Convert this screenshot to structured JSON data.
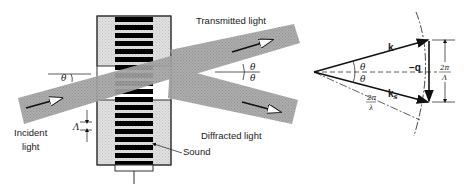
{
  "left_diagram": {
    "title": "Acousto-optic Bragg diffraction",
    "labels": {
      "transmitted": "Transmitted light",
      "diffracted": "Diffracted light",
      "incident_line1": "Incident",
      "incident_line2": "light",
      "sound": "Sound",
      "theta_incident": "θ",
      "theta_out_top": "θ",
      "theta_out_bottom": "θ",
      "wavelength": "Λ"
    },
    "grating_lines": 15,
    "colors": {
      "beam": "#9a9a9a",
      "cell": "#d8d8d8",
      "stripes": "#000000",
      "outline": "#333333"
    }
  },
  "right_diagram": {
    "title": "Wave-vector diagram",
    "labels": {
      "k": "k",
      "ks": "k",
      "ks_sub": "s",
      "q": "−q",
      "theta_top": "θ",
      "theta_bottom": "θ",
      "radius_num": "2π",
      "radius_den": "λ",
      "q_mag_num": "2π",
      "q_mag_den": "Λ"
    }
  }
}
